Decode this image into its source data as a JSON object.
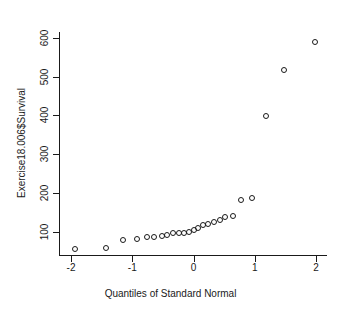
{
  "chart_data": {
    "type": "scatter",
    "title": "",
    "xlabel": "Quantiles of Standard Normal",
    "ylabel": "Exercise18.006$Survival",
    "xlim": [
      -2.18,
      2.18
    ],
    "ylim": [
      40,
      615
    ],
    "xticks": [
      -2,
      -1,
      0,
      1,
      2
    ],
    "xticklabels": [
      "-2",
      "-1",
      "0",
      "1",
      "2"
    ],
    "yticks": [
      100,
      200,
      300,
      400,
      500,
      600
    ],
    "yticklabels": [
      "100",
      "200",
      "300",
      "400",
      "500",
      "600"
    ],
    "grid": false,
    "legend": null,
    "marker": "open-circle",
    "marker_color": "#1a1a1a",
    "background": "#ffffff",
    "n_points": 25,
    "x": [
      -1.94,
      -1.43,
      -1.15,
      -0.93,
      -0.76,
      -0.64,
      -0.52,
      -0.43,
      -0.33,
      -0.24,
      -0.16,
      -0.08,
      0.0,
      0.08,
      0.16,
      0.24,
      0.33,
      0.43,
      0.52,
      0.64,
      0.78,
      0.95,
      1.18,
      1.47,
      1.99
    ],
    "y": [
      55,
      58,
      78,
      82,
      87,
      87,
      89,
      91,
      97,
      97,
      98,
      99,
      104,
      110,
      117,
      120,
      125,
      131,
      138,
      141,
      182,
      188,
      399,
      517,
      590
    ],
    "points": [
      {
        "x": -1.94,
        "y": 55
      },
      {
        "x": -1.43,
        "y": 58
      },
      {
        "x": -1.15,
        "y": 78
      },
      {
        "x": -0.93,
        "y": 82
      },
      {
        "x": -0.76,
        "y": 87
      },
      {
        "x": -0.64,
        "y": 87
      },
      {
        "x": -0.52,
        "y": 89
      },
      {
        "x": -0.43,
        "y": 91
      },
      {
        "x": -0.33,
        "y": 97
      },
      {
        "x": -0.24,
        "y": 97
      },
      {
        "x": -0.16,
        "y": 98
      },
      {
        "x": -0.08,
        "y": 99
      },
      {
        "x": 0.0,
        "y": 104
      },
      {
        "x": 0.08,
        "y": 110
      },
      {
        "x": 0.16,
        "y": 117
      },
      {
        "x": 0.24,
        "y": 120
      },
      {
        "x": 0.33,
        "y": 125
      },
      {
        "x": 0.43,
        "y": 131
      },
      {
        "x": 0.52,
        "y": 138
      },
      {
        "x": 0.64,
        "y": 141
      },
      {
        "x": 0.78,
        "y": 182
      },
      {
        "x": 0.95,
        "y": 188
      },
      {
        "x": 1.18,
        "y": 399
      },
      {
        "x": 1.47,
        "y": 517
      },
      {
        "x": 1.99,
        "y": 590
      }
    ]
  }
}
